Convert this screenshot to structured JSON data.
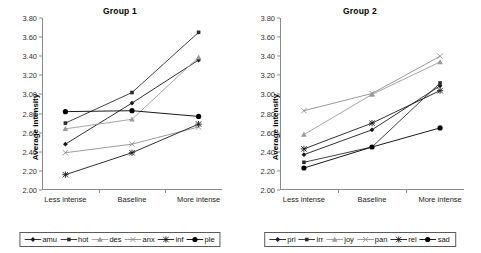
{
  "figure": {
    "y_axis_label": "Average intensity",
    "y_ticks": [
      "2.00",
      "2.20",
      "2.40",
      "2.60",
      "2.80",
      "3.00",
      "3.20",
      "3.40",
      "3.60",
      "3.80"
    ],
    "x_categories": [
      "Less intense",
      "Baseline",
      "More intense"
    ]
  },
  "panels": [
    {
      "title": "Group 1"
    },
    {
      "title": "Group 2"
    }
  ],
  "chart_data": [
    {
      "type": "line",
      "title": "Group 1",
      "xlabel": "",
      "ylabel": "Average intensity",
      "categories": [
        "Less intense",
        "Baseline",
        "More intense"
      ],
      "ylim": [
        2.0,
        3.8
      ],
      "ytick_step": 0.2,
      "grid": false,
      "legend_position": "below",
      "series": [
        {
          "name": "amu",
          "marker": "diamond",
          "color": "#1a1a1a",
          "values": [
            2.48,
            2.91,
            3.36
          ]
        },
        {
          "name": "hot",
          "marker": "square",
          "color": "#2b2b2b",
          "values": [
            2.7,
            3.02,
            3.65
          ]
        },
        {
          "name": "des",
          "marker": "triangle",
          "color": "#9a9a9a",
          "values": [
            2.64,
            2.74,
            3.39
          ]
        },
        {
          "name": "anx",
          "marker": "cross-x",
          "color": "#8f8f8f",
          "values": [
            2.39,
            2.48,
            2.66
          ]
        },
        {
          "name": "inf",
          "marker": "asterisk",
          "color": "#1a1a1a",
          "values": [
            2.16,
            2.39,
            2.69
          ]
        },
        {
          "name": "ple",
          "marker": "circle",
          "color": "#000000",
          "values": [
            2.82,
            2.83,
            2.77
          ]
        }
      ]
    },
    {
      "type": "line",
      "title": "Group 2",
      "xlabel": "",
      "ylabel": "Average intensity",
      "categories": [
        "Less intense",
        "Baseline",
        "More intense"
      ],
      "ylim": [
        2.0,
        3.8
      ],
      "ytick_step": 0.2,
      "grid": false,
      "legend_position": "below",
      "series": [
        {
          "name": "pri",
          "marker": "diamond",
          "color": "#1a1a1a",
          "values": [
            2.37,
            2.63,
            3.09
          ]
        },
        {
          "name": "irr",
          "marker": "square",
          "color": "#2b2b2b",
          "values": [
            2.29,
            2.45,
            3.12
          ]
        },
        {
          "name": "joy",
          "marker": "triangle",
          "color": "#9a9a9a",
          "values": [
            2.58,
            3.0,
            3.34
          ]
        },
        {
          "name": "pan",
          "marker": "cross-x",
          "color": "#8f8f8f",
          "values": [
            2.83,
            3.01,
            3.4
          ]
        },
        {
          "name": "rel",
          "marker": "asterisk",
          "color": "#1a1a1a",
          "values": [
            2.43,
            2.7,
            3.04
          ]
        },
        {
          "name": "sad",
          "marker": "circle",
          "color": "#000000",
          "values": [
            2.23,
            2.45,
            2.65
          ]
        }
      ]
    }
  ]
}
